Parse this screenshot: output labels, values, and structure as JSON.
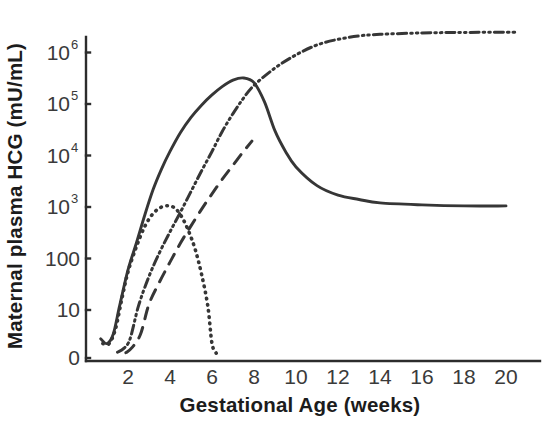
{
  "chart_data": {
    "type": "line",
    "title": "",
    "xlabel": "Gestational Age (weeks)",
    "ylabel": "Maternal plasma HCG  (mU/mL)",
    "x_ticks": [
      "2",
      "4",
      "6",
      "8",
      "10",
      "12",
      "14",
      "16",
      "18",
      "20"
    ],
    "x_tick_values": [
      2,
      4,
      6,
      8,
      10,
      12,
      14,
      16,
      18,
      20
    ],
    "xlim": [
      0,
      21
    ],
    "y_ticks": [
      {
        "label": "0",
        "exp": "",
        "value": 0
      },
      {
        "label": "10",
        "exp": "",
        "value": 10
      },
      {
        "label": "100",
        "exp": "",
        "value": 100
      },
      {
        "label": "10",
        "exp": "3",
        "value": 1000
      },
      {
        "label": "10",
        "exp": "4",
        "value": 10000
      },
      {
        "label": "10",
        "exp": "5",
        "value": 100000
      },
      {
        "label": "10",
        "exp": "6",
        "value": 1000000
      }
    ],
    "y_scale": "log (with 0 baseline)",
    "ylim": [
      0,
      1000000
    ],
    "grid": false,
    "legend": "none",
    "colors": {
      "line": "#363636",
      "axis": "#2c2c2c",
      "text": "#1c1c1c",
      "background": "#ffffff"
    },
    "series": [
      {
        "name": "total HCG (solid)",
        "style": "solid",
        "points": [
          {
            "x": 0.7,
            "y": 4
          },
          {
            "x": 1.0,
            "y": 3
          },
          {
            "x": 1.3,
            "y": 5
          },
          {
            "x": 1.6,
            "y": 12
          },
          {
            "x": 2.0,
            "y": 60
          },
          {
            "x": 2.4,
            "y": 200
          },
          {
            "x": 2.8,
            "y": 700
          },
          {
            "x": 3.2,
            "y": 2200
          },
          {
            "x": 3.6,
            "y": 5500
          },
          {
            "x": 4.0,
            "y": 12000
          },
          {
            "x": 4.5,
            "y": 28000
          },
          {
            "x": 5.0,
            "y": 55000
          },
          {
            "x": 5.5,
            "y": 95000
          },
          {
            "x": 6.0,
            "y": 150000
          },
          {
            "x": 6.5,
            "y": 220000
          },
          {
            "x": 7.0,
            "y": 290000
          },
          {
            "x": 7.5,
            "y": 320000
          },
          {
            "x": 8.0,
            "y": 260000
          },
          {
            "x": 8.5,
            "y": 110000
          },
          {
            "x": 9.0,
            "y": 30000
          },
          {
            "x": 9.5,
            "y": 12000
          },
          {
            "x": 10.0,
            "y": 6000
          },
          {
            "x": 11.0,
            "y": 2600
          },
          {
            "x": 12.0,
            "y": 1700
          },
          {
            "x": 13.0,
            "y": 1400
          },
          {
            "x": 14.0,
            "y": 1200
          },
          {
            "x": 16.0,
            "y": 1100
          },
          {
            "x": 18.0,
            "y": 1050
          },
          {
            "x": 20.0,
            "y": 1050
          }
        ]
      },
      {
        "name": "placental HCG (dash-dot-dot)",
        "style": "dash-dot-dot",
        "points": [
          {
            "x": 1.5,
            "y": 1.2
          },
          {
            "x": 1.8,
            "y": 2
          },
          {
            "x": 2.1,
            "y": 4
          },
          {
            "x": 2.5,
            "y": 12
          },
          {
            "x": 3.0,
            "y": 45
          },
          {
            "x": 3.5,
            "y": 130
          },
          {
            "x": 4.0,
            "y": 330
          },
          {
            "x": 4.5,
            "y": 800
          },
          {
            "x": 5.0,
            "y": 2000
          },
          {
            "x": 5.5,
            "y": 5000
          },
          {
            "x": 6.0,
            "y": 12000
          },
          {
            "x": 6.5,
            "y": 30000
          },
          {
            "x": 7.0,
            "y": 65000
          },
          {
            "x": 7.5,
            "y": 130000
          },
          {
            "x": 8.0,
            "y": 230000
          },
          {
            "x": 9.0,
            "y": 500000
          },
          {
            "x": 10.0,
            "y": 900000
          },
          {
            "x": 11.0,
            "y": 1400000
          },
          {
            "x": 12.0,
            "y": 1800000
          },
          {
            "x": 13.0,
            "y": 2100000
          },
          {
            "x": 14.0,
            "y": 2250000
          },
          {
            "x": 16.0,
            "y": 2400000
          },
          {
            "x": 18.0,
            "y": 2450000
          },
          {
            "x": 20.5,
            "y": 2480000
          }
        ]
      },
      {
        "name": "free beta subunit (long dashes)",
        "style": "dashed",
        "points": [
          {
            "x": 1.9,
            "y": 1.1
          },
          {
            "x": 2.2,
            "y": 2.2
          },
          {
            "x": 2.6,
            "y": 5
          },
          {
            "x": 3.0,
            "y": 13
          },
          {
            "x": 3.5,
            "y": 35
          },
          {
            "x": 4.0,
            "y": 85
          },
          {
            "x": 4.5,
            "y": 200
          },
          {
            "x": 5.0,
            "y": 430
          },
          {
            "x": 5.5,
            "y": 900
          },
          {
            "x": 6.0,
            "y": 1800
          },
          {
            "x": 6.5,
            "y": 3500
          },
          {
            "x": 7.0,
            "y": 6500
          },
          {
            "x": 7.5,
            "y": 12000
          },
          {
            "x": 7.9,
            "y": 19000
          }
        ]
      },
      {
        "name": "hyperglycosylated HCG (fine dots)",
        "style": "dotted",
        "points": [
          {
            "x": 0.8,
            "y": 3
          },
          {
            "x": 1.1,
            "y": 3
          },
          {
            "x": 1.4,
            "y": 6
          },
          {
            "x": 1.7,
            "y": 16
          },
          {
            "x": 2.0,
            "y": 55
          },
          {
            "x": 2.4,
            "y": 170
          },
          {
            "x": 2.8,
            "y": 420
          },
          {
            "x": 3.2,
            "y": 750
          },
          {
            "x": 3.6,
            "y": 1000
          },
          {
            "x": 4.0,
            "y": 1050
          },
          {
            "x": 4.3,
            "y": 900
          },
          {
            "x": 4.6,
            "y": 600
          },
          {
            "x": 4.9,
            "y": 330
          },
          {
            "x": 5.2,
            "y": 150
          },
          {
            "x": 5.5,
            "y": 50
          },
          {
            "x": 5.8,
            "y": 12
          },
          {
            "x": 6.0,
            "y": 3
          },
          {
            "x": 6.2,
            "y": 1
          }
        ]
      }
    ]
  }
}
